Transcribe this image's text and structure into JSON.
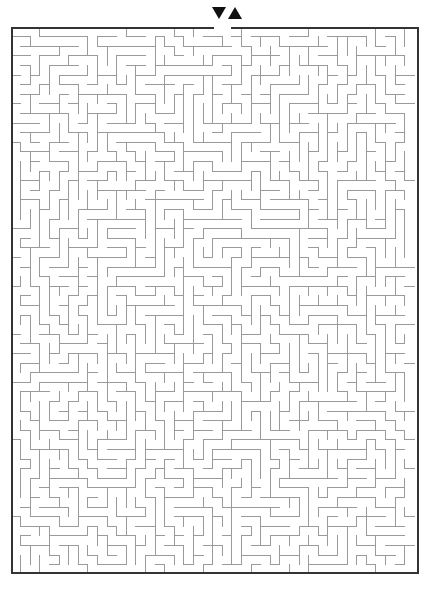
{
  "page": {
    "background_color": "#ffffff",
    "width": 432,
    "height": 590
  },
  "maze": {
    "label": "rectangular grid maze",
    "origin_x": 11,
    "origin_y": 27,
    "width": 408,
    "height": 547,
    "cols": 42,
    "rows": 57,
    "cell_size": 9.6,
    "wall_color": "#9a9a9a",
    "wall_thickness": 1,
    "border_color": "#333333",
    "border_thickness": 2,
    "fill_color": "#ffffff",
    "entrance": {
      "label": "entrance",
      "col": 21,
      "side": "top"
    },
    "exit": {
      "label": "exit",
      "col": 22,
      "side": "top"
    },
    "seed": 20240517
  },
  "markers": {
    "entrance": {
      "icon": "triangle-down-icon",
      "label": "entrance arrow",
      "color": "#111111",
      "x": 212,
      "y": 7,
      "direction": "down"
    },
    "exit": {
      "icon": "triangle-up-icon",
      "label": "exit arrow",
      "color": "#111111",
      "x": 228,
      "y": 7,
      "direction": "up"
    }
  }
}
